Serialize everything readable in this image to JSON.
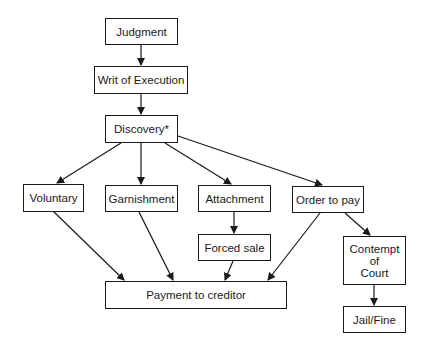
{
  "diagram": {
    "type": "flowchart",
    "nodes": [
      {
        "id": "judgment",
        "label": "Judgment"
      },
      {
        "id": "writ",
        "label": "Writ of Execution"
      },
      {
        "id": "discovery",
        "label": "Discovery*"
      },
      {
        "id": "voluntary",
        "label": "Voluntary"
      },
      {
        "id": "garnishment",
        "label": "Garnishment"
      },
      {
        "id": "attachment",
        "label": "Attachment"
      },
      {
        "id": "order",
        "label": "Order to pay"
      },
      {
        "id": "forced_sale",
        "label": "Forced sale"
      },
      {
        "id": "contempt",
        "label": "Contempt\nof\nCourt"
      },
      {
        "id": "payment",
        "label": "Payment to creditor"
      },
      {
        "id": "jail",
        "label": "Jail/Fine"
      }
    ],
    "edges": [
      {
        "from": "judgment",
        "to": "writ"
      },
      {
        "from": "writ",
        "to": "discovery"
      },
      {
        "from": "discovery",
        "to": "voluntary"
      },
      {
        "from": "discovery",
        "to": "garnishment"
      },
      {
        "from": "discovery",
        "to": "attachment"
      },
      {
        "from": "discovery",
        "to": "order"
      },
      {
        "from": "attachment",
        "to": "forced_sale"
      },
      {
        "from": "order",
        "to": "contempt"
      },
      {
        "from": "voluntary",
        "to": "payment"
      },
      {
        "from": "garnishment",
        "to": "payment"
      },
      {
        "from": "forced_sale",
        "to": "payment"
      },
      {
        "from": "order",
        "to": "payment"
      },
      {
        "from": "contempt",
        "to": "jail"
      }
    ]
  }
}
